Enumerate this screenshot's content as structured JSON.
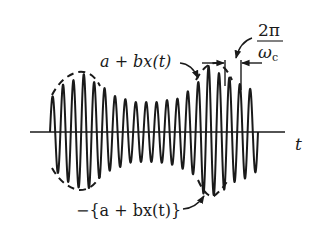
{
  "diagram": {
    "axis": {
      "label": "t",
      "x_start": 30,
      "x_end": 285,
      "y": 132
    },
    "labels": {
      "upper_envelope": "a + bx(t)",
      "lower_envelope": "−{a + bx(t)}",
      "period_numerator": "2π",
      "period_denominator_symbol": "ω",
      "period_denominator_subscript": "c"
    },
    "waveform": {
      "start_x": 50,
      "end_x": 258,
      "cycles": 20,
      "envelope_points": [
        [
          50,
          35
        ],
        [
          68,
          50
        ],
        [
          85,
          58
        ],
        [
          100,
          46
        ],
        [
          115,
          36
        ],
        [
          135,
          30
        ],
        [
          155,
          30
        ],
        [
          175,
          33
        ],
        [
          192,
          42
        ],
        [
          208,
          66
        ],
        [
          222,
          58
        ],
        [
          240,
          48
        ],
        [
          258,
          40
        ]
      ]
    },
    "colors": {
      "ink": "#1a1a1a",
      "background": "#ffffff"
    }
  }
}
